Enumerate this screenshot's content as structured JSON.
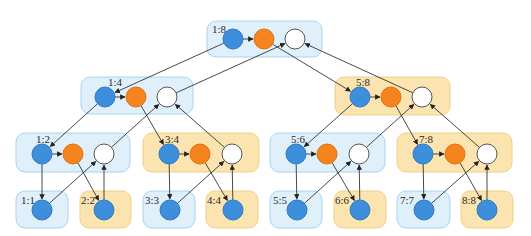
{
  "colors": {
    "blue_node": "#3d8fdc",
    "blue_node_stroke": "#2f78c0",
    "orange_node": "#f5841f",
    "orange_node_stroke": "#e07010",
    "white_node": "#ffffff",
    "white_node_stroke": "#555555",
    "blue_box_fill": "#dff0fa",
    "blue_box_stroke": "#a8d4ee",
    "yellow_box_fill": "#fbe4b0",
    "yellow_box_stroke": "#f0cf88",
    "edge": "#333333"
  },
  "node_radius": 10,
  "boxes": [
    {
      "id": "1:8",
      "label": "1:8",
      "theme": "blue",
      "x": 207,
      "y": 21,
      "w": 115,
      "h": 36,
      "label_x": 212,
      "label_y": 33,
      "nodes": [
        {
          "id": "b18",
          "kind": "blue",
          "cx": 233,
          "cy": 39
        },
        {
          "id": "o18",
          "kind": "orange",
          "cx": 264,
          "cy": 39
        },
        {
          "id": "w18",
          "kind": "white",
          "cx": 295,
          "cy": 39
        }
      ]
    },
    {
      "id": "1:4",
      "label": "1:4",
      "theme": "blue",
      "x": 81,
      "y": 77,
      "w": 112,
      "h": 37,
      "label_x": 108,
      "label_y": 86,
      "nodes": [
        {
          "id": "b14",
          "kind": "blue",
          "cx": 105,
          "cy": 97
        },
        {
          "id": "o14",
          "kind": "orange",
          "cx": 136,
          "cy": 97
        },
        {
          "id": "w14",
          "kind": "white",
          "cx": 167,
          "cy": 97
        }
      ]
    },
    {
      "id": "5:8",
      "label": "5:8",
      "theme": "yellow",
      "x": 335,
      "y": 77,
      "w": 115,
      "h": 38,
      "label_x": 356,
      "label_y": 86,
      "nodes": [
        {
          "id": "b58",
          "kind": "blue",
          "cx": 360,
          "cy": 97
        },
        {
          "id": "o58",
          "kind": "orange",
          "cx": 391,
          "cy": 97
        },
        {
          "id": "w58",
          "kind": "white",
          "cx": 422,
          "cy": 97
        }
      ]
    },
    {
      "id": "1:2",
      "label": "1:2",
      "theme": "blue",
      "x": 16,
      "y": 133,
      "w": 114,
      "h": 39,
      "label_x": 36,
      "label_y": 143,
      "nodes": [
        {
          "id": "b12",
          "kind": "blue",
          "cx": 42,
          "cy": 154
        },
        {
          "id": "o12",
          "kind": "orange",
          "cx": 73,
          "cy": 154
        },
        {
          "id": "w12",
          "kind": "white",
          "cx": 104,
          "cy": 154
        }
      ]
    },
    {
      "id": "3:4",
      "label": "3:4",
      "theme": "yellow",
      "x": 143,
      "y": 133,
      "w": 116,
      "h": 39,
      "label_x": 165,
      "label_y": 143,
      "nodes": [
        {
          "id": "b34",
          "kind": "blue",
          "cx": 169,
          "cy": 154
        },
        {
          "id": "o34",
          "kind": "orange",
          "cx": 200,
          "cy": 154
        },
        {
          "id": "w34",
          "kind": "white",
          "cx": 232,
          "cy": 154
        }
      ]
    },
    {
      "id": "5:6",
      "label": "5:6",
      "theme": "blue",
      "x": 270,
      "y": 133,
      "w": 115,
      "h": 39,
      "label_x": 291,
      "label_y": 143,
      "nodes": [
        {
          "id": "b56",
          "kind": "blue",
          "cx": 296,
          "cy": 154
        },
        {
          "id": "o56",
          "kind": "orange",
          "cx": 327,
          "cy": 154
        },
        {
          "id": "w56",
          "kind": "white",
          "cx": 359,
          "cy": 154
        }
      ]
    },
    {
      "id": "7:8",
      "label": "7:8",
      "theme": "yellow",
      "x": 397,
      "y": 133,
      "w": 115,
      "h": 39,
      "label_x": 419,
      "label_y": 143,
      "nodes": [
        {
          "id": "b78",
          "kind": "blue",
          "cx": 423,
          "cy": 154
        },
        {
          "id": "o78",
          "kind": "orange",
          "cx": 455,
          "cy": 154
        },
        {
          "id": "w78",
          "kind": "white",
          "cx": 487,
          "cy": 154
        }
      ]
    },
    {
      "id": "1:1",
      "label": "1:1",
      "theme": "blue",
      "x": 16,
      "y": 191,
      "w": 52,
      "h": 37,
      "label_x": 21,
      "label_y": 204,
      "nodes": [
        {
          "id": "b11",
          "kind": "blue",
          "cx": 42,
          "cy": 210
        }
      ]
    },
    {
      "id": "2:2",
      "label": "2:2",
      "theme": "yellow",
      "x": 80,
      "y": 191,
      "w": 51,
      "h": 37,
      "label_x": 81,
      "label_y": 204,
      "nodes": [
        {
          "id": "b22",
          "kind": "blue",
          "cx": 104,
          "cy": 210
        }
      ]
    },
    {
      "id": "3:3",
      "label": "3:3",
      "theme": "blue",
      "x": 143,
      "y": 191,
      "w": 52,
      "h": 37,
      "label_x": 145,
      "label_y": 204,
      "nodes": [
        {
          "id": "b33",
          "kind": "blue",
          "cx": 170,
          "cy": 210
        }
      ]
    },
    {
      "id": "4:4",
      "label": "4:4",
      "theme": "yellow",
      "x": 206,
      "y": 191,
      "w": 52,
      "h": 37,
      "label_x": 207,
      "label_y": 204,
      "nodes": [
        {
          "id": "b44",
          "kind": "blue",
          "cx": 233,
          "cy": 210
        }
      ]
    },
    {
      "id": "5:5",
      "label": "5:5",
      "theme": "blue",
      "x": 270,
      "y": 191,
      "w": 52,
      "h": 37,
      "label_x": 273,
      "label_y": 204,
      "nodes": [
        {
          "id": "b55",
          "kind": "blue",
          "cx": 297,
          "cy": 210
        }
      ]
    },
    {
      "id": "6:6",
      "label": "6:6",
      "theme": "yellow",
      "x": 334,
      "y": 191,
      "w": 52,
      "h": 37,
      "label_x": 335,
      "label_y": 204,
      "nodes": [
        {
          "id": "b66",
          "kind": "blue",
          "cx": 360,
          "cy": 210
        }
      ]
    },
    {
      "id": "7:7",
      "label": "7:7",
      "theme": "blue",
      "x": 397,
      "y": 191,
      "w": 53,
      "h": 37,
      "label_x": 400,
      "label_y": 204,
      "nodes": [
        {
          "id": "b77",
          "kind": "blue",
          "cx": 424,
          "cy": 210
        }
      ]
    },
    {
      "id": "8:8",
      "label": "8:8",
      "theme": "yellow",
      "x": 461,
      "y": 191,
      "w": 52,
      "h": 37,
      "label_x": 462,
      "label_y": 204,
      "nodes": [
        {
          "id": "b88",
          "kind": "blue",
          "cx": 487,
          "cy": 210
        }
      ]
    }
  ],
  "edges": [
    {
      "from": "b18",
      "to": "o18"
    },
    {
      "from": "b18",
      "to": "b14"
    },
    {
      "from": "o18",
      "to": "b58"
    },
    {
      "from": "w14",
      "to": "w18"
    },
    {
      "from": "w58",
      "to": "w18"
    },
    {
      "from": "b14",
      "to": "o14"
    },
    {
      "from": "b14",
      "to": "b12"
    },
    {
      "from": "o14",
      "to": "b34"
    },
    {
      "from": "w12",
      "to": "w14"
    },
    {
      "from": "w34",
      "to": "w14"
    },
    {
      "from": "b58",
      "to": "o58"
    },
    {
      "from": "b58",
      "to": "b56"
    },
    {
      "from": "o58",
      "to": "b78"
    },
    {
      "from": "w56",
      "to": "w58"
    },
    {
      "from": "w78",
      "to": "w58"
    },
    {
      "from": "b12",
      "to": "o12"
    },
    {
      "from": "b12",
      "to": "b11"
    },
    {
      "from": "o12",
      "to": "b22"
    },
    {
      "from": "b11",
      "to": "w12"
    },
    {
      "from": "b22",
      "to": "w12"
    },
    {
      "from": "b34",
      "to": "o34"
    },
    {
      "from": "b34",
      "to": "b33"
    },
    {
      "from": "o34",
      "to": "b44"
    },
    {
      "from": "b33",
      "to": "w34"
    },
    {
      "from": "b44",
      "to": "w34"
    },
    {
      "from": "b56",
      "to": "o56"
    },
    {
      "from": "b56",
      "to": "b55"
    },
    {
      "from": "o56",
      "to": "b66"
    },
    {
      "from": "b55",
      "to": "w56"
    },
    {
      "from": "b66",
      "to": "w56"
    },
    {
      "from": "b78",
      "to": "o78"
    },
    {
      "from": "b78",
      "to": "b77"
    },
    {
      "from": "o78",
      "to": "b88"
    },
    {
      "from": "b77",
      "to": "w78"
    },
    {
      "from": "b88",
      "to": "w78"
    }
  ]
}
